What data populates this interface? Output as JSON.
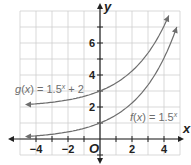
{
  "chart_data": {
    "type": "line",
    "title": "",
    "xlabel": "x",
    "ylabel": "y",
    "origin_label": "O",
    "xlim": [
      -5,
      5
    ],
    "ylim": [
      -1,
      8
    ],
    "grid": true,
    "x_ticks": [
      -4,
      -2,
      2,
      4
    ],
    "y_ticks": [
      2,
      4,
      6
    ],
    "x_tick_labels": [
      "−4",
      "−2",
      "2",
      "4"
    ],
    "y_tick_labels": [
      "2",
      "4",
      "6"
    ],
    "series": [
      {
        "name": "g(x) = 1.5^x + 2",
        "label_prefix": "g(x) = 1.5",
        "label_exp": "x",
        "label_suffix": " + 2",
        "x": [
          -4.5,
          -4,
          -3,
          -2,
          -1,
          0,
          1,
          2,
          3,
          4,
          4.3
        ],
        "y": [
          2.16,
          2.2,
          2.3,
          2.44,
          2.67,
          3,
          3.5,
          4.25,
          5.38,
          7.06,
          7.72
        ]
      },
      {
        "name": "f(x) = 1.5^x",
        "label_prefix": "f(x) = 1.5",
        "label_exp": "x",
        "label_suffix": "",
        "x": [
          -4.5,
          -4,
          -3,
          -2,
          -1,
          0,
          1,
          2,
          3,
          4,
          4.8
        ],
        "y": [
          0.16,
          0.2,
          0.3,
          0.44,
          0.67,
          1,
          1.5,
          2.25,
          3.38,
          5.06,
          7.0
        ]
      }
    ]
  }
}
